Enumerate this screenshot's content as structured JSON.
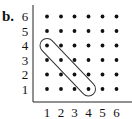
{
  "panel_label": "b.",
  "chart_data": {
    "type": "scatter",
    "title": "",
    "xlabel": "",
    "ylabel": "",
    "x_ticks": [
      "1",
      "2",
      "3",
      "4",
      "5",
      "6"
    ],
    "y_ticks": [
      "1",
      "2",
      "3",
      "4",
      "5",
      "6"
    ],
    "xlim": [
      1,
      6
    ],
    "ylim": [
      1,
      6
    ],
    "grid": false,
    "points": "all integer pairs (x,y) with x in 1..6 and y in 1..6 (36 points)",
    "highlighted": {
      "description": "loop enclosing diagonal points",
      "points": [
        [
          1,
          4
        ],
        [
          2,
          3
        ],
        [
          3,
          2
        ],
        [
          4,
          1
        ]
      ]
    }
  },
  "colors": {
    "ink": "#111111",
    "loop": "#333333"
  }
}
